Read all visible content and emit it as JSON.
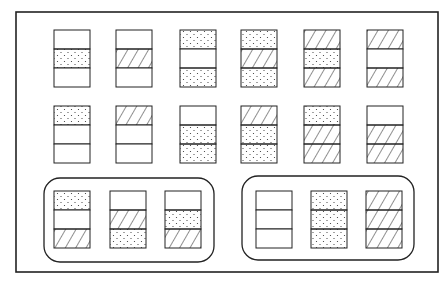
{
  "diagram": {
    "frame": {
      "x": 16,
      "y": 12,
      "w": 422,
      "h": 260
    },
    "cell": {
      "w": 36,
      "h": 19
    },
    "patterns": {
      "E": "empty",
      "D": "dotted",
      "H": "hatched"
    },
    "rows": [
      {
        "y": 30,
        "xs": [
          54,
          116,
          180,
          241,
          304,
          367
        ],
        "stacks": [
          [
            "E",
            "D",
            "E"
          ],
          [
            "E",
            "H",
            "E"
          ],
          [
            "D",
            "E",
            "D"
          ],
          [
            "D",
            "H",
            "D"
          ],
          [
            "H",
            "D",
            "H"
          ],
          [
            "H",
            "E",
            "H"
          ]
        ]
      },
      {
        "y": 106,
        "xs": [
          54,
          116,
          180,
          241,
          304,
          367
        ],
        "stacks": [
          [
            "D",
            "E",
            "E"
          ],
          [
            "H",
            "E",
            "E"
          ],
          [
            "E",
            "D",
            "D"
          ],
          [
            "H",
            "D",
            "D"
          ],
          [
            "D",
            "H",
            "H"
          ],
          [
            "E",
            "H",
            "H"
          ]
        ]
      }
    ],
    "groups": [
      {
        "x": 44,
        "y": 178,
        "w": 170,
        "h": 84,
        "stack_y": 191,
        "xs": [
          54,
          110,
          165
        ],
        "stacks": [
          [
            "D",
            "E",
            "H"
          ],
          [
            "E",
            "H",
            "D"
          ],
          [
            "E",
            "D",
            "H"
          ]
        ]
      },
      {
        "x": 242,
        "y": 176,
        "w": 172,
        "h": 84,
        "stack_y": 191,
        "xs": [
          256,
          311,
          366
        ],
        "stacks": [
          [
            "E",
            "E",
            "E"
          ],
          [
            "D",
            "D",
            "D"
          ],
          [
            "H",
            "H",
            "H"
          ]
        ]
      }
    ],
    "colors": {
      "line": "#222222",
      "background": "#ffffff"
    }
  }
}
